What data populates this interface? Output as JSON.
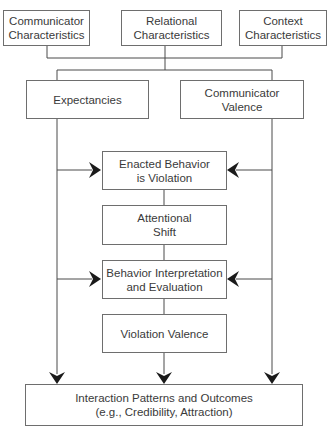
{
  "diagram": {
    "type": "flowchart",
    "inputs": [
      {
        "id": "communicator-characteristics",
        "lines": [
          "Communicator",
          "Characteristics"
        ]
      },
      {
        "id": "relational-characteristics",
        "lines": [
          "Relational",
          "Characteristics"
        ]
      },
      {
        "id": "context-characteristics",
        "lines": [
          "Context",
          "Characteristics"
        ]
      }
    ],
    "mediators": [
      {
        "id": "expectancies",
        "lines": [
          "Expectancies"
        ]
      },
      {
        "id": "communicator-valence",
        "lines": [
          "Communicator",
          "Valence"
        ]
      }
    ],
    "process": [
      {
        "id": "enacted-behavior",
        "lines": [
          "Enacted Behavior",
          "is Violation"
        ]
      },
      {
        "id": "attentional-shift",
        "lines": [
          "Attentional",
          "Shift"
        ]
      },
      {
        "id": "behavior-interpretation",
        "lines": [
          "Behavior Interpretation",
          "and Evaluation"
        ]
      },
      {
        "id": "violation-valence",
        "lines": [
          "Violation Valence"
        ]
      }
    ],
    "outcome": {
      "id": "interaction-patterns",
      "lines": [
        "Interaction Patterns and Outcomes",
        "(e.g., Credibility, Attraction)"
      ]
    },
    "edges": [
      {
        "from": "communicator-characteristics",
        "to": [
          "expectancies",
          "communicator-valence"
        ]
      },
      {
        "from": "relational-characteristics",
        "to": [
          "expectancies",
          "communicator-valence"
        ]
      },
      {
        "from": "context-characteristics",
        "to": [
          "expectancies",
          "communicator-valence"
        ]
      },
      {
        "from": "expectancies",
        "to": "enacted-behavior"
      },
      {
        "from": "expectancies",
        "to": "behavior-interpretation"
      },
      {
        "from": "expectancies",
        "to": "interaction-patterns"
      },
      {
        "from": "communicator-valence",
        "to": "enacted-behavior"
      },
      {
        "from": "communicator-valence",
        "to": "behavior-interpretation"
      },
      {
        "from": "communicator-valence",
        "to": "interaction-patterns"
      },
      {
        "from": "enacted-behavior",
        "to": "attentional-shift"
      },
      {
        "from": "attentional-shift",
        "to": "behavior-interpretation"
      },
      {
        "from": "behavior-interpretation",
        "to": "violation-valence"
      },
      {
        "from": "violation-valence",
        "to": "interaction-patterns"
      }
    ]
  }
}
